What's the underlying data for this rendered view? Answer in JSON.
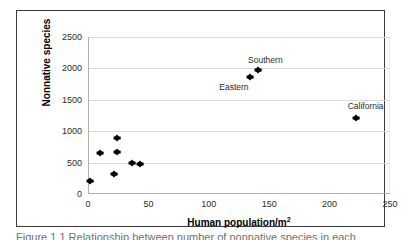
{
  "figure": {
    "caption": "Figure 1.1   Relationship between number of nonnative species in each"
  },
  "chart_data": {
    "type": "scatter",
    "title": "",
    "xlabel": "Human population/m",
    "xlabel_sup": "2",
    "ylabel": "Nonnative species",
    "xlim": [
      0,
      250
    ],
    "ylim": [
      0,
      2500
    ],
    "xticks": [
      0,
      50,
      100,
      150,
      200,
      250
    ],
    "yticks": [
      0,
      500,
      1000,
      1500,
      2000,
      2500
    ],
    "xtick_labels": [
      "0",
      "50",
      "100",
      "150",
      "200",
      "250"
    ],
    "ytick_labels": [
      "0",
      "500",
      "1000",
      "1500",
      "2000",
      "2500"
    ],
    "grid": "horizontal",
    "legend": "none",
    "marker_color": "#000000",
    "points": [
      {
        "x": 1,
        "y": 200,
        "label": ""
      },
      {
        "x": 9,
        "y": 650,
        "label": ""
      },
      {
        "x": 21,
        "y": 320,
        "label": ""
      },
      {
        "x": 23,
        "y": 890,
        "label": ""
      },
      {
        "x": 23,
        "y": 670,
        "label": ""
      },
      {
        "x": 36,
        "y": 490,
        "label": ""
      },
      {
        "x": 42,
        "y": 480,
        "label": ""
      },
      {
        "x": 133,
        "y": 1870,
        "label": "Eastern"
      },
      {
        "x": 140,
        "y": 1980,
        "label": "Southern"
      },
      {
        "x": 221,
        "y": 1210,
        "label": "California"
      }
    ],
    "annotations": [
      {
        "text": "Southern",
        "x": 146,
        "y": 2130
      },
      {
        "text": "Eastern",
        "x": 120,
        "y": 1700
      },
      {
        "text": "California",
        "x": 229,
        "y": 1400
      }
    ]
  }
}
